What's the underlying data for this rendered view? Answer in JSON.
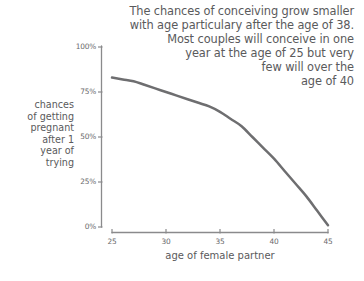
{
  "chart_data": {
    "type": "line",
    "title": "The chances of conceiving grow smaller\nwith age particulary after the age of 38.\nMost couples will conceive in one\nyear at the age of 25 but very\nfew will over the\nage of 40",
    "title_lines": [
      "The chances of conceiving grow smaller",
      "with age particulary after the age of 38.",
      "Most couples will conceive in one",
      "year at the age of 25 but very",
      "few will over the",
      "age of 40"
    ],
    "xlabel": "age of female partner",
    "ylabel": "chances\nof getting\npregnant\nafter 1\nyear of\ntrying",
    "ylabel_lines": [
      "chances",
      "of getting",
      "pregnant",
      "after 1",
      "year of",
      "trying"
    ],
    "xlim": [
      25,
      45
    ],
    "ylim": [
      0,
      100
    ],
    "xticks": [
      25,
      30,
      35,
      40,
      45
    ],
    "xtick_labels": [
      "25",
      "30",
      "35",
      "40",
      "45"
    ],
    "yticks": [
      0,
      25,
      50,
      75,
      100
    ],
    "ytick_labels": [
      "0%",
      "25%",
      "50%",
      "75%",
      "100%"
    ],
    "grid": false,
    "legend": "none",
    "series": [
      {
        "name": "chances of getting pregnant after 1 year of trying",
        "color": "#6e6e70",
        "x": [
          25,
          26,
          27,
          28,
          29,
          30,
          31,
          32,
          33,
          34,
          35,
          36,
          37,
          38,
          39,
          40,
          41,
          42,
          43,
          44,
          45
        ],
        "values": [
          83,
          82,
          81,
          79,
          77,
          75,
          73,
          71,
          69,
          67,
          64,
          60,
          56,
          50,
          44,
          38,
          31,
          24,
          17,
          9,
          1
        ]
      }
    ],
    "colors": {
      "line": "#6e6e70",
      "axis": "#8a8a8c",
      "text": "#5a5a5c",
      "tick_text": "#6a6a6c",
      "background": "#ffffff"
    }
  }
}
